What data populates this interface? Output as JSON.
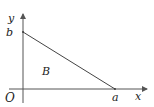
{
  "diagram": {
    "type": "coordinate-region",
    "axes": {
      "x_label": "x",
      "y_label": "y",
      "origin_label": "O"
    },
    "points": {
      "x_intercept_label": "a",
      "y_intercept_label": "b"
    },
    "region_label": "B",
    "colors": {
      "axis": "#555555",
      "line": "#444444",
      "text": "#222222",
      "background": "#ffffff"
    }
  }
}
